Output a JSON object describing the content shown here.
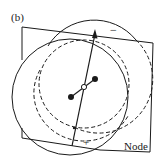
{
  "figure": {
    "panel_label": "(b)",
    "node_label": "Node",
    "minus_sign": "−",
    "plus_sign": "+",
    "colors": {
      "stroke": "#1a1a1a",
      "background": "#ffffff"
    }
  }
}
